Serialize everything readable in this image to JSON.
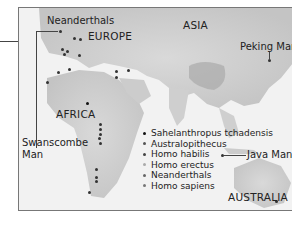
{
  "map": {
    "regions": {
      "europe": "EUROPE",
      "asia": "ASIA",
      "africa": "AFRICA",
      "australia": "AUSTRALIA"
    },
    "callouts": {
      "neanderthals": "Neanderthals",
      "peking_man": "Peking Man",
      "swanscombe_line1": "Swanscombe",
      "swanscombe_line2": "Man",
      "java_man": "Java Man"
    },
    "legend": {
      "items": [
        {
          "label": "Sahelanthropus tchadensis",
          "color": "#111111"
        },
        {
          "label": "Australopithecus",
          "color": "#555555"
        },
        {
          "label": "Homo habilis",
          "color": "#444444"
        },
        {
          "label": "Homo erectus",
          "color": "#aaaaaa"
        },
        {
          "label": "Neanderthals",
          "color": "#666666"
        },
        {
          "label": "Homo sapiens",
          "color": "#777777"
        }
      ]
    }
  }
}
